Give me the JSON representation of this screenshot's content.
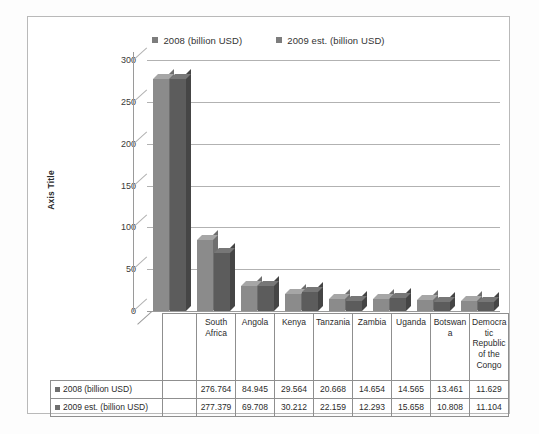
{
  "chart_data": {
    "type": "bar",
    "title": "",
    "xlabel": "",
    "ylabel": "Axis Title",
    "ylim": [
      0,
      300
    ],
    "yticks": [
      300,
      250,
      200,
      150,
      100,
      50,
      0
    ],
    "grid": true,
    "legend_position": "top-center",
    "categories": [
      "South Africa",
      "Angola",
      "Kenya",
      "Tanzania",
      "Zambia",
      "Uganda",
      "Botswana",
      "Democratic Republic of the Congo"
    ],
    "category_labels_wrapped": [
      "South\nAfrica",
      "Angola",
      "Kenya",
      "Tanzania",
      "Zambia",
      "Uganda",
      "Botswan\na",
      "Democra\ntic\nRepublic\nof the\nCongo"
    ],
    "series": [
      {
        "name": "2008 (billion USD)",
        "color": "#8b8b8b",
        "values": [
          276.764,
          84.945,
          29.564,
          20.668,
          14.654,
          14.565,
          13.461,
          11.629
        ]
      },
      {
        "name": "2009 est. (billion USD)",
        "color": "#5c5c5c",
        "values": [
          277.379,
          69.708,
          30.212,
          22.159,
          12.293,
          15.658,
          10.808,
          11.104
        ]
      }
    ]
  },
  "legend": {
    "items": [
      {
        "label": "2008 (billion USD)"
      },
      {
        "label": "2009 est. (billion USD)"
      }
    ]
  },
  "axis": {
    "y_title": "Axis Title"
  },
  "table": {
    "rows": [
      {
        "label": "2008 (billion USD)",
        "values": [
          "276.764",
          "84.945",
          "29.564",
          "20.668",
          "14.654",
          "14.565",
          "13.461",
          "11.629"
        ]
      },
      {
        "label": "2009 est. (billion USD)",
        "values": [
          "277.379",
          "69.708",
          "30.212",
          "22.159",
          "12.293",
          "15.658",
          "10.808",
          "11.104"
        ]
      }
    ]
  }
}
